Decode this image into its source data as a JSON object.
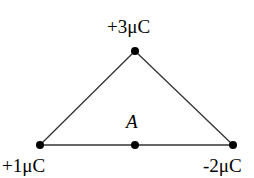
{
  "diagram": {
    "type": "charge-triangle",
    "charges": [
      {
        "id": "top",
        "label": "+3μC",
        "x": 135,
        "y": 51
      },
      {
        "id": "left",
        "label": "+1μC",
        "x": 40,
        "y": 145
      },
      {
        "id": "right",
        "label": "-2μC",
        "x": 233,
        "y": 145
      }
    ],
    "point": {
      "id": "A",
      "label": "A",
      "x": 135,
      "y": 145
    },
    "colors": {
      "line": "#333333",
      "dot": "#000000"
    }
  }
}
